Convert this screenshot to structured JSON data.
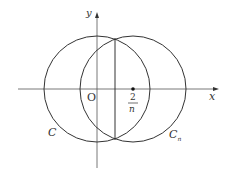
{
  "diagram": {
    "axes": {
      "x_label": "x",
      "y_label": "y",
      "origin_label": "O"
    },
    "circles": [
      {
        "name": "C",
        "label": "C"
      },
      {
        "name": "Cn",
        "label": "C",
        "subscript": "n"
      }
    ],
    "point": {
      "numerator": "2",
      "denominator": "n"
    },
    "colors": {
      "stroke": "#333333",
      "axis": "#555555"
    }
  }
}
